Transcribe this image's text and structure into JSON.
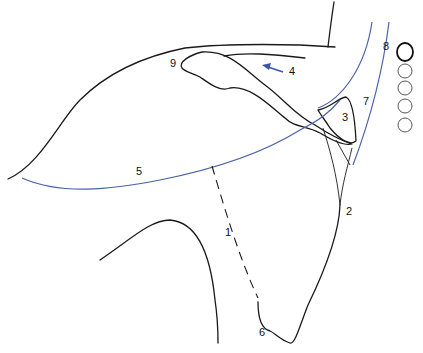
{
  "diagram": {
    "title": "",
    "labels": [
      {
        "id": "1",
        "text": "1",
        "x": 225,
        "y": 236
      },
      {
        "id": "2",
        "text": "2",
        "x": 346,
        "y": 215
      },
      {
        "id": "3",
        "text": "3",
        "x": 342,
        "y": 121
      },
      {
        "id": "4",
        "text": "4",
        "x": 289,
        "y": 75
      },
      {
        "id": "5",
        "text": "5",
        "x": 136,
        "y": 175
      },
      {
        "id": "6",
        "text": "6",
        "x": 259,
        "y": 336
      },
      {
        "id": "7",
        "text": "7",
        "x": 363,
        "y": 105
      },
      {
        "id": "8",
        "text": "8",
        "x": 383,
        "y": 50
      },
      {
        "id": "9",
        "text": "9",
        "x": 170,
        "y": 67
      }
    ],
    "colors": {
      "outline": "#1a1a1a",
      "blue_line": "#4a62a8",
      "arrow": "#3a55b0"
    },
    "arrow": {
      "label": "4",
      "color": "blue"
    }
  }
}
